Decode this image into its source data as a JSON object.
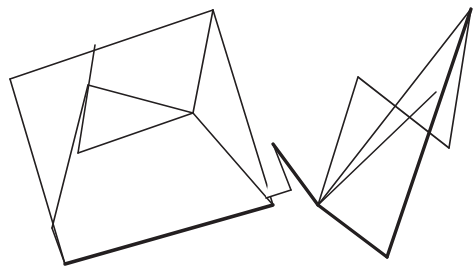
{
  "canvas": {
    "width": 474,
    "height": 269,
    "background_color": "#ffffff",
    "ink_color": "#231f20",
    "description": "Line drawing of two unfolded polygonal net shapes"
  },
  "stroke_widths": {
    "thin": 1.6,
    "thick": 3.4
  },
  "figures": [
    {
      "name": "left-quadrilateral-net",
      "outline": [
        {
          "name": "left-outline-edge-top",
          "weight": "thin",
          "points": "10,79 213,10"
        },
        {
          "name": "left-outline-edge-right-upper",
          "weight": "thin",
          "points": "213,10 273,205"
        },
        {
          "name": "left-outline-edge-bottom",
          "weight": "thick",
          "points": "273,205 65,264"
        },
        {
          "name": "left-outline-edge-left",
          "weight": "thin",
          "points": "65,264 10,79"
        }
      ],
      "creases": [
        {
          "name": "left-crease-a",
          "weight": "thin",
          "points": "95,45 78,153"
        },
        {
          "name": "left-crease-b",
          "weight": "thin",
          "points": "78,153 193,113"
        },
        {
          "name": "left-crease-c",
          "weight": "thin",
          "points": "88,85 193,113"
        },
        {
          "name": "left-crease-d",
          "weight": "thin",
          "points": "193,113 213,10"
        },
        {
          "name": "left-crease-e",
          "weight": "thin",
          "points": "88,85 52,228"
        },
        {
          "name": "left-crease-f",
          "weight": "thin",
          "points": "52,228 65,264"
        },
        {
          "name": "left-crease-g",
          "weight": "thin",
          "points": "193,113 273,205"
        }
      ]
    },
    {
      "name": "right-triangular-fan-net",
      "outline": [
        {
          "name": "right-outline-edge-top",
          "weight": "thin",
          "points": "318,205 471,9"
        },
        {
          "name": "right-outline-edge-right",
          "weight": "thick",
          "points": "471,9 387,257"
        },
        {
          "name": "right-outline-edge-bottom",
          "weight": "thick",
          "points": "387,257 318,205"
        },
        {
          "name": "right-outline-edge-left",
          "weight": "thick",
          "points": "318,205 273,144"
        }
      ],
      "creases": [
        {
          "name": "right-crease-fan-1",
          "weight": "thin",
          "points": "318,205 358,77"
        },
        {
          "name": "right-crease-fan-2",
          "weight": "thin",
          "points": "318,205 471,9"
        },
        {
          "name": "right-crease-fan-3",
          "weight": "thin",
          "points": "318,205 436,92"
        },
        {
          "name": "right-crease-ridge",
          "weight": "thin",
          "points": "358,77 449,148"
        },
        {
          "name": "right-crease-upper-right",
          "weight": "thin",
          "points": "449,148 471,9"
        },
        {
          "name": "right-crease-tab",
          "weight": "thin",
          "points": "273,144 291,190"
        },
        {
          "name": "right-crease-tab-edge",
          "weight": "thin",
          "points": "291,190 266,198"
        }
      ]
    }
  ],
  "vertices": {
    "left_top_apex": [
      213,
      10
    ],
    "left_west_corner": [
      10,
      79
    ],
    "left_south_corner": [
      65,
      264
    ],
    "left_east_corner": [
      273,
      205
    ],
    "left_inner_hub": [
      193,
      113
    ],
    "right_fan_point": [
      318,
      205
    ],
    "right_top_apex": [
      471,
      9
    ],
    "right_bottom_corner": [
      387,
      257
    ],
    "right_mid_left": [
      358,
      77
    ],
    "right_mid_right": [
      449,
      148
    ]
  }
}
